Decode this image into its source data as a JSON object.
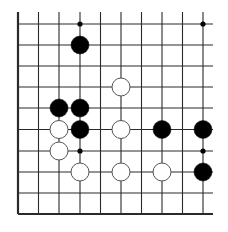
{
  "board": {
    "title": "Go board fragment (bottom-left corner)",
    "columns": 10,
    "rows": 10,
    "col_x": [
      18,
      38.5,
      59,
      80,
      100.5,
      121,
      141.5,
      162,
      182.5,
      203
    ],
    "row_y": [
      24,
      45,
      66,
      87,
      108,
      129.5,
      151,
      172,
      193,
      214
    ],
    "line_extent": {
      "top": 12,
      "right": 213
    },
    "edges": {
      "left": true,
      "bottom": true,
      "top": false,
      "right": false
    },
    "colors": {
      "line": "#2a2a2a",
      "black_stone": "#000000",
      "white_stone": "#ffffff",
      "white_stone_border": "#555555",
      "background": "#ffffff"
    },
    "stone_radius": 9,
    "star_points": [
      {
        "col": 3,
        "row": 0
      },
      {
        "col": 9,
        "row": 0
      },
      {
        "col": 3,
        "row": 6
      },
      {
        "col": 9,
        "row": 6
      }
    ],
    "stones": [
      {
        "color": "black",
        "col": 3,
        "row": 1
      },
      {
        "color": "white",
        "col": 5,
        "row": 3
      },
      {
        "color": "black",
        "col": 2,
        "row": 4
      },
      {
        "color": "black",
        "col": 3,
        "row": 4
      },
      {
        "color": "white",
        "col": 2,
        "row": 5
      },
      {
        "color": "black",
        "col": 3,
        "row": 5
      },
      {
        "color": "white",
        "col": 5,
        "row": 5
      },
      {
        "color": "black",
        "col": 7,
        "row": 5
      },
      {
        "color": "black",
        "col": 9,
        "row": 5
      },
      {
        "color": "white",
        "col": 2,
        "row": 6
      },
      {
        "color": "white",
        "col": 3,
        "row": 7
      },
      {
        "color": "white",
        "col": 5,
        "row": 7
      },
      {
        "color": "white",
        "col": 7,
        "row": 7
      },
      {
        "color": "black",
        "col": 9,
        "row": 7
      }
    ]
  }
}
